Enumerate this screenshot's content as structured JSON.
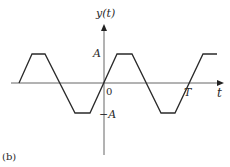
{
  "figure": {
    "panel_label": "(b)",
    "y_axis_label": "y(t)",
    "x_axis_label": "t",
    "ticks": {
      "amplitude_pos": "A",
      "amplitude_neg": "−A",
      "origin": "0",
      "period": "T"
    },
    "waveform": {
      "type": "trapezoidal periodic wave",
      "stroke_color": "#2a2a2a",
      "axis_color": "#555555"
    }
  }
}
